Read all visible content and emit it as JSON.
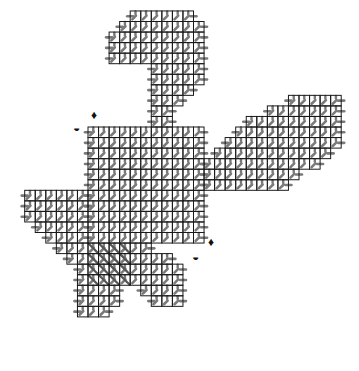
{
  "diagram": {
    "type": "plastic-canvas-stitch-chart",
    "cell_size": 10.55,
    "origin": {
      "x": 88,
      "y": 127
    },
    "colors": {
      "grid": "#1a1a1a",
      "stitch": "#7a7a7a",
      "stitch_light": "#b5b5b5",
      "background": "#ffffff"
    },
    "pieces": [
      {
        "name": "top-lobe",
        "rows": [
          {
            "r": -11,
            "c0": 4,
            "c1": 10
          },
          {
            "r": -10,
            "c0": 3,
            "c1": 11
          },
          {
            "r": -9,
            "c0": 2,
            "c1": 11
          },
          {
            "r": -8,
            "c0": 2,
            "c1": 11
          },
          {
            "r": -7,
            "c0": 2,
            "c1": 11
          },
          {
            "r": -6,
            "c0": 6,
            "c1": 11
          },
          {
            "r": -5,
            "c0": 6,
            "c1": 11
          },
          {
            "r": -4,
            "c0": 6,
            "c1": 10
          },
          {
            "r": -3,
            "c0": 6,
            "c1": 9
          },
          {
            "r": -2,
            "c0": 6,
            "c1": 8
          },
          {
            "r": -1,
            "c0": 6,
            "c1": 8
          }
        ]
      },
      {
        "name": "center-square",
        "rows": [
          {
            "r": 0,
            "c0": 0,
            "c1": 11
          },
          {
            "r": 1,
            "c0": 0,
            "c1": 11
          },
          {
            "r": 2,
            "c0": 0,
            "c1": 11
          },
          {
            "r": 3,
            "c0": 0,
            "c1": 11
          },
          {
            "r": 4,
            "c0": 0,
            "c1": 11
          },
          {
            "r": 5,
            "c0": 0,
            "c1": 11
          },
          {
            "r": 6,
            "c0": 0,
            "c1": 11
          },
          {
            "r": 7,
            "c0": 0,
            "c1": 11
          },
          {
            "r": 8,
            "c0": 0,
            "c1": 11
          },
          {
            "r": 9,
            "c0": 0,
            "c1": 11
          },
          {
            "r": 10,
            "c0": 0,
            "c1": 11
          }
        ]
      },
      {
        "name": "right-wing",
        "rows": [
          {
            "r": -3,
            "c0": 19,
            "c1": 24
          },
          {
            "r": -2,
            "c0": 17,
            "c1": 24
          },
          {
            "r": -1,
            "c0": 15,
            "c1": 24
          },
          {
            "r": 0,
            "c0": 14,
            "c1": 24
          },
          {
            "r": 1,
            "c0": 13,
            "c1": 24
          },
          {
            "r": 2,
            "c0": 12,
            "c1": 23
          },
          {
            "r": 3,
            "c0": 11,
            "c1": 22
          },
          {
            "r": 4,
            "c0": 11,
            "c1": 20
          },
          {
            "r": 5,
            "c0": 11,
            "c1": 19
          }
        ]
      },
      {
        "name": "left-arm",
        "rows": [
          {
            "r": 6,
            "c0": -6,
            "c1": 0
          },
          {
            "r": 7,
            "c0": -6,
            "c1": 0
          },
          {
            "r": 8,
            "c0": -6,
            "c1": 0
          },
          {
            "r": 9,
            "c0": -5,
            "c1": 0
          },
          {
            "r": 10,
            "c0": -4,
            "c1": 0
          },
          {
            "r": 11,
            "c0": -3,
            "c1": 6
          },
          {
            "r": 12,
            "c0": -2,
            "c1": 8
          },
          {
            "r": 13,
            "c0": -1,
            "c1": 9
          },
          {
            "r": 14,
            "c0": -1,
            "c1": 9
          },
          {
            "r": 15,
            "c0": -1,
            "c1": 3
          },
          {
            "r": 15,
            "c0": 5,
            "c1": 9
          },
          {
            "r": 16,
            "c0": -1,
            "c1": 3
          },
          {
            "r": 16,
            "c0": 6,
            "c1": 9
          },
          {
            "r": 17,
            "c0": -1,
            "c1": 2
          }
        ]
      }
    ],
    "hatched_region": {
      "r0": 11,
      "r1": 15,
      "c0": 0,
      "c1": 4
    },
    "markers": [
      {
        "name": "diamond-marker-top",
        "symbol": "♦",
        "x": 91,
        "y": 109
      },
      {
        "name": "half-circle-marker-top",
        "symbol": "◒",
        "x": 73,
        "y": 122
      },
      {
        "name": "diamond-marker-bottom",
        "symbol": "♦",
        "x": 208,
        "y": 236
      },
      {
        "name": "half-circle-marker-bottom",
        "symbol": "◒",
        "x": 192,
        "y": 251
      }
    ]
  }
}
